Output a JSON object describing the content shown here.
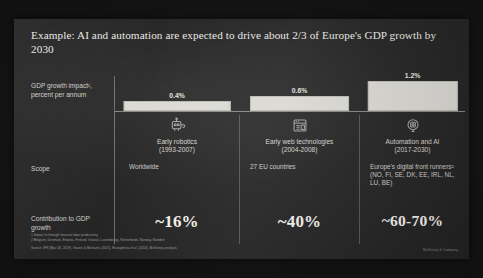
{
  "slide": {
    "title": "Example: AI and automation are expected to drive about 2/3 of Europe's GDP growth by 2030",
    "row_labels": {
      "gdp_growth": "GDP growth impact¹, percent per annum",
      "scope": "Scope",
      "contribution": "Contribution to GDP growth"
    },
    "footnote_1": "1 Impact at through forecast labor productivity",
    "footnote_2": "2 Belgium, Denmark, Estonia, Finland, Ireland, Luxembourg, Netherlands, Norway, Sweden",
    "source": "Source: IFR (Mar 26, 2019), Graetz & Michaels (2015), Evangelista et al. (2014), McKinsey analysis",
    "corner_mark": "McKinsey & Company"
  },
  "chart_data": {
    "type": "bar",
    "title": "Example: AI and automation are expected to drive about 2/3 of Europe's GDP growth by 2030",
    "xlabel": "",
    "ylabel": "GDP growth impact¹, percent per annum",
    "ylim": [
      0,
      1.4
    ],
    "grid": false,
    "legend": "none",
    "categories": [
      "Early robotics (1993-2007)",
      "Early web technologies (2004-2008)",
      "Automation and AI (2017-2030)"
    ],
    "values": [
      0.4,
      0.6,
      1.2
    ],
    "value_labels": [
      "0.4%",
      "0.6%",
      "1.2%"
    ],
    "bar_color": "#d9d8d3",
    "columns": [
      {
        "icon": "robot-icon",
        "label_line1": "Early robotics",
        "label_line2": "(1993-2007)",
        "value_label": "0.4%",
        "value": 0.4,
        "scope": "Worldwide",
        "contribution": "~16%"
      },
      {
        "icon": "browser-window-icon",
        "label_line1": "Early web technologies",
        "label_line2": "(2004-2008)",
        "value_label": "0.6%",
        "value": 0.6,
        "scope": "27 EU countries",
        "contribution": "~40%"
      },
      {
        "icon": "brain-chip-icon",
        "label_line1": "Automation and AI",
        "label_line2": "(2017-2030)",
        "value_label": "1.2%",
        "value": 1.2,
        "scope": "Europe's digital front runners² (NO, FI, SE, DK, EE, IRL, NL, LU, BE)",
        "contribution": "~60-70%"
      }
    ]
  }
}
